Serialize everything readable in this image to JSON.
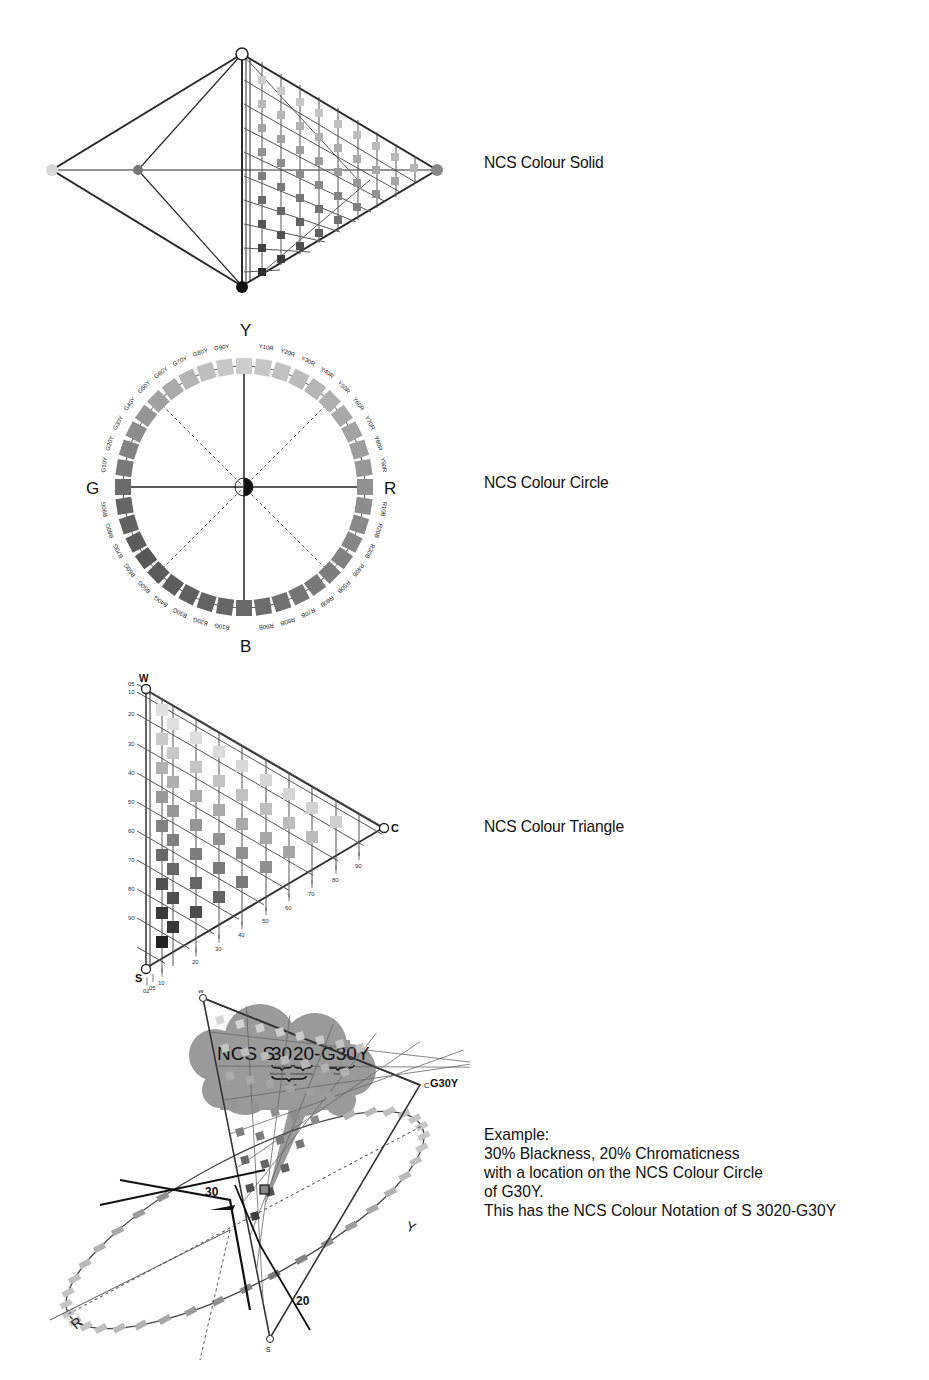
{
  "sections": {
    "solid": {
      "caption": "NCS Colour Solid"
    },
    "circle": {
      "caption": "NCS Colour Circle",
      "poles": {
        "top": "Y",
        "right": "R",
        "bottom": "B",
        "left": "G"
      },
      "hue_labels_top_left": [
        "G10Y",
        "G20Y",
        "G30Y",
        "G40Y",
        "G50Y",
        "G60Y",
        "G70Y",
        "G80Y",
        "G90Y"
      ],
      "hue_labels_top_right": [
        "Y10R",
        "Y20R",
        "Y30R",
        "Y40R",
        "Y50R",
        "Y60R",
        "Y70R",
        "Y80R",
        "Y90R"
      ],
      "hue_labels_bottom_right": [
        "R10B",
        "R20B",
        "R30B",
        "R40B",
        "R50B",
        "R60B",
        "R70B",
        "R80B",
        "R90B"
      ],
      "hue_labels_bottom_left": [
        "B10G",
        "B20G",
        "B30G",
        "B40G",
        "B50G",
        "B60G",
        "B70G",
        "B80G",
        "B90G"
      ]
    },
    "triangle": {
      "caption": "NCS Colour Triangle",
      "corners": {
        "white": "W",
        "black": "S",
        "chromatic": "C"
      },
      "left_ticks": [
        "05",
        "10",
        "20",
        "30",
        "40",
        "50",
        "60",
        "70",
        "80",
        "90"
      ],
      "bottom_ticks": [
        "02",
        "05",
        "10",
        "20",
        "30",
        "40",
        "50",
        "60",
        "70",
        "80",
        "90"
      ]
    },
    "example": {
      "cloud": {
        "prefix": "NCS S",
        "blackness": "30",
        "chromaticness": "20",
        "dash": "-",
        "hue": "G30Y",
        "sub_blackness": "blackness",
        "sub_chromaticness": "chromaticness",
        "sub_hue": "hue",
        "sub_nuance": "nuance"
      },
      "diagram_labels": {
        "blackness_marker": "30",
        "chromaticness_marker": "20",
        "hue_marker": "G30Y",
        "white": "W",
        "black": "S",
        "chromatic": "C",
        "y_pole": "Y",
        "r_pole": "R"
      },
      "text_lines": [
        "Example:",
        "30% Blackness,  20% Chromaticness",
        "with a location on the NCS Colour Circle",
        "of G30Y.",
        "This has the NCS Colour Notation of S 3020-G30Y"
      ]
    }
  },
  "colors": {
    "line": "#2a2a2a",
    "swatch_light": "#d6d6d6",
    "swatch_mid": "#8c8c8c",
    "swatch_dark": "#2e2e2e",
    "cloud": "#9a9a9a"
  }
}
